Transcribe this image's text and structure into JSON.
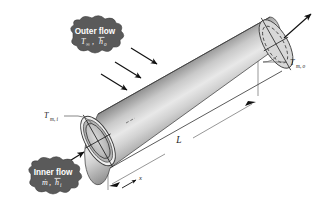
{
  "figure": {
    "background_color": "#ffffff",
    "line_color": "#1a1a1a",
    "cloud_fill": "#5a5a5a",
    "cloud_text_color": "#ffffff",
    "tube_light": "#f2f2f2",
    "tube_mid": "#b9b9b9",
    "tube_dark": "#6e6e6e"
  },
  "labels": {
    "outer_flow": {
      "heading": "Outer flow",
      "symbols": "T",
      "symbol_sub_1": "∞",
      "symbol_2": "h",
      "symbol_sub_2": "o",
      "comma": ",",
      "full_text": "T∞, h̄o"
    },
    "inner_flow": {
      "heading": "Inner flow",
      "symbol_1": "ṁ",
      "comma": ",",
      "symbol_2": "h",
      "symbol_sub_2": "i",
      "full_text": "ṁ, h̄i"
    },
    "inlet_temp": {
      "symbol": "T",
      "subscript": "m, i",
      "full_text": "Tm, i"
    },
    "outlet_temp": {
      "symbol": "T",
      "subscript": "m, o",
      "full_text": "Tm, o"
    },
    "length": {
      "symbol": "L"
    },
    "axis": {
      "symbol": "x"
    }
  },
  "icons": {
    "outer_flow_arrows": "arrow-down-right-icon",
    "inner_flow_arrow": "arrow-up-right-icon",
    "outlet_flow_arrow": "arrow-up-right-icon",
    "dimension_arrow_left": "dimension-arrow-icon",
    "dimension_arrow_right": "dimension-arrow-icon",
    "axis_arrow": "axis-arrow-icon"
  },
  "geometry": {
    "tube_axis_start": [
      98,
      141
    ],
    "tube_axis_end": [
      270,
      44
    ],
    "tube_radius_px": 26,
    "left_face_outer_rx": 12,
    "left_face_outer_ry": 27,
    "left_face_inner_rx": 8.5,
    "left_face_inner_ry": 20
  }
}
